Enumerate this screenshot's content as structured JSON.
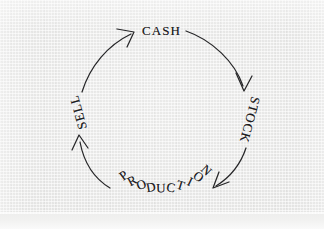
{
  "page": {
    "background_color": "#ebebea",
    "ink_color": "#1d1d1f"
  },
  "diagram": {
    "type": "cycle",
    "direction": "clockwise",
    "nodes": [
      {
        "id": "cash",
        "label": "CASH",
        "position": "top",
        "rotation_deg": 0
      },
      {
        "id": "stock",
        "label": "STOCK",
        "position": "right",
        "rotation_deg": 105
      },
      {
        "id": "production",
        "label": "PRODUCTION",
        "position": "bottom",
        "rotation_deg": 0,
        "curved": true
      },
      {
        "id": "sell",
        "label": "SELL",
        "position": "left",
        "rotation_deg": -105
      }
    ],
    "arrows": [
      {
        "id": "cash-to-stock",
        "from": "CASH",
        "to": "STOCK"
      },
      {
        "id": "stock-to-production",
        "from": "STOCK",
        "to": "PRODUCTION"
      },
      {
        "id": "production-to-sell",
        "from": "PRODUCTION",
        "to": "SELL"
      },
      {
        "id": "sell-to-cash",
        "from": "SELL",
        "to": "CASH"
      }
    ]
  }
}
